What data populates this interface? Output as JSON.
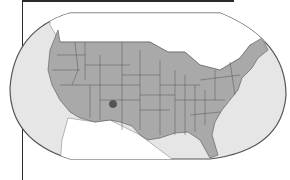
{
  "map": {
    "subject": "United States map within rounded frame",
    "colors": {
      "ocean": "#e6e6e6",
      "land_us": "#a9a9a9",
      "land_other": "#ffffff",
      "border": "#555555",
      "frame": "#555555",
      "marker": "#555555"
    },
    "marker": {
      "label": "location-marker",
      "x": 113,
      "y": 104
    }
  }
}
